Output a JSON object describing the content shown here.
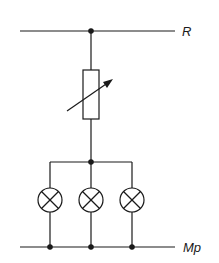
{
  "diagram": {
    "type": "circuit-schematic",
    "labels": {
      "top_rail": "R",
      "bottom_rail": "Mp"
    },
    "components": [
      {
        "id": "rheostat",
        "kind": "variable-resistor"
      },
      {
        "id": "lamp-1",
        "kind": "lamp"
      },
      {
        "id": "lamp-2",
        "kind": "lamp"
      },
      {
        "id": "lamp-3",
        "kind": "lamp"
      }
    ],
    "colors": {
      "stroke": "#1a1a1a",
      "background": "#ffffff"
    }
  }
}
